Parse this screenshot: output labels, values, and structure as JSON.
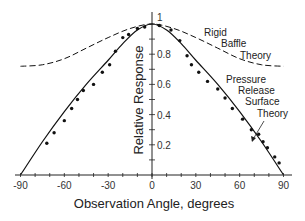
{
  "chart_data": {
    "type": "line",
    "title": "",
    "xlabel": "Observation Angle, degrees",
    "ylabel": "Relative Response",
    "xlim": [
      -90,
      90
    ],
    "ylim": [
      0,
      1
    ],
    "xticks": [
      -90,
      -60,
      -30,
      0,
      30,
      60,
      90
    ],
    "xtick_labels": [
      "-90",
      "-60",
      "-30",
      "0",
      "30",
      "60",
      "90"
    ],
    "yticks": [
      0.2,
      0.4,
      0.6,
      0.8,
      1
    ],
    "ytick_labels": [
      "0.2",
      "0.4",
      "0.6",
      "0.8",
      "1"
    ],
    "grid": false,
    "legend": "none (curves annotated inline)",
    "series": [
      {
        "name": "Rigid Baffle Theory",
        "style": "dashed",
        "x": [
          -90,
          -75,
          -60,
          -45,
          -30,
          -15,
          0,
          15,
          30,
          45,
          60,
          75,
          90
        ],
        "y": [
          0.72,
          0.73,
          0.77,
          0.84,
          0.91,
          0.97,
          1.0,
          0.97,
          0.91,
          0.84,
          0.77,
          0.73,
          0.72
        ]
      },
      {
        "name": "Pressure Release Surface Theory",
        "style": "solid",
        "x": [
          -90,
          -75,
          -60,
          -45,
          -30,
          -20,
          -10,
          0,
          10,
          20,
          30,
          45,
          60,
          75,
          90
        ],
        "y": [
          0.0,
          0.22,
          0.42,
          0.6,
          0.76,
          0.87,
          0.96,
          1.0,
          0.96,
          0.87,
          0.76,
          0.6,
          0.42,
          0.22,
          0.0
        ]
      },
      {
        "name": "Measured",
        "style": "markers",
        "x": [
          -72,
          -67,
          -60,
          -55,
          -51,
          -47,
          -40,
          -34,
          -29,
          -25,
          -20,
          -16,
          -10,
          -5,
          5,
          13,
          19,
          24,
          27,
          32,
          38,
          45,
          50,
          55,
          62,
          68,
          73,
          76,
          79,
          84,
          87
        ],
        "y": [
          0.21,
          0.28,
          0.36,
          0.44,
          0.5,
          0.56,
          0.6,
          0.68,
          0.73,
          0.82,
          0.91,
          0.93,
          0.97,
          0.98,
          0.99,
          0.96,
          0.89,
          0.79,
          0.73,
          0.68,
          0.62,
          0.57,
          0.51,
          0.44,
          0.37,
          0.3,
          0.27,
          0.22,
          0.18,
          0.12,
          0.08
        ]
      }
    ],
    "annotations": [
      {
        "text_lines": [
          "Rigid",
          "Baffle",
          "Theory"
        ],
        "target": "Rigid Baffle Theory"
      },
      {
        "text_lines": [
          "Pressure",
          "Release",
          "Surface",
          "Theory"
        ],
        "target": "Pressure Release Surface Theory",
        "arrow": true
      }
    ]
  },
  "labels": {
    "xlabel": "Observation Angle, degrees",
    "ylabel": "Relative Response",
    "rigid": [
      "Rigid",
      "Baffle",
      "Theory"
    ],
    "pressure": [
      "Pressure",
      "Release",
      "Surface",
      "Theory"
    ]
  }
}
